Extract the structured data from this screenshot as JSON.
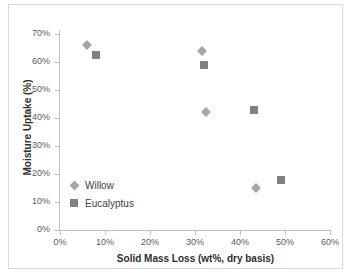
{
  "chart_data": {
    "type": "scatter",
    "title": "",
    "xlabel": "Solid Mass Loss (wt%, dry basis)",
    "ylabel": "Moisture Uptake (%)",
    "xlim": [
      0,
      60
    ],
    "ylim": [
      0,
      70
    ],
    "xticks": [
      "0%",
      "10%",
      "20%",
      "30%",
      "40%",
      "50%",
      "60%"
    ],
    "xtick_values": [
      0,
      10,
      20,
      30,
      40,
      50,
      60
    ],
    "yticks": [
      "0%",
      "10%",
      "20%",
      "30%",
      "40%",
      "50%",
      "60%",
      "70%"
    ],
    "ytick_values": [
      0,
      10,
      20,
      30,
      40,
      50,
      60,
      70
    ],
    "grid": false,
    "legend_position": "inside-lower-left",
    "series": [
      {
        "name": "Willow",
        "marker": "diamond",
        "color": "#a6a6a6",
        "points": [
          {
            "x": 6.0,
            "y": 66.0
          },
          {
            "x": 31.5,
            "y": 64.0
          },
          {
            "x": 32.5,
            "y": 42.0
          },
          {
            "x": 43.5,
            "y": 15.0
          }
        ]
      },
      {
        "name": "Eucalyptus",
        "marker": "square",
        "color": "#808080",
        "points": [
          {
            "x": 8.0,
            "y": 62.5
          },
          {
            "x": 32.0,
            "y": 59.0
          },
          {
            "x": 43.0,
            "y": 43.0
          },
          {
            "x": 49.0,
            "y": 18.0
          }
        ]
      }
    ]
  },
  "legend": {
    "items": [
      {
        "label": "Willow",
        "marker": "diamond",
        "color": "#a6a6a6"
      },
      {
        "label": "Eucalyptus",
        "marker": "square",
        "color": "#808080"
      }
    ]
  },
  "colors": {
    "willow": "#a6a6a6",
    "eucalyptus": "#808080",
    "axis": "#bfbfbf",
    "text": "#3f3f3f",
    "frame": "#d9d9d9"
  }
}
